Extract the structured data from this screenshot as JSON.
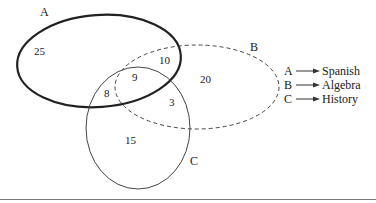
{
  "diagram": {
    "type": "venn",
    "sets": [
      {
        "id": "A",
        "label": "A",
        "subject": "Spanish",
        "style": "thick-solid"
      },
      {
        "id": "B",
        "label": "B",
        "subject": "Algebra",
        "style": "dashed"
      },
      {
        "id": "C",
        "label": "C",
        "subject": "History",
        "style": "thin-solid"
      }
    ],
    "regions": {
      "A_only": "25",
      "A_and_B_only": "10",
      "A_and_B_and_C": "9",
      "A_and_C_only": "8",
      "B_and_C_only": "3",
      "B_only": "20",
      "C_only": "15"
    }
  },
  "legend": {
    "items": [
      {
        "letter": "A",
        "text": "Spanish"
      },
      {
        "letter": "B",
        "text": "Algebra"
      },
      {
        "letter": "C",
        "text": "History"
      }
    ]
  },
  "colors": {
    "stroke": "#222222",
    "background": "#ffffff"
  }
}
